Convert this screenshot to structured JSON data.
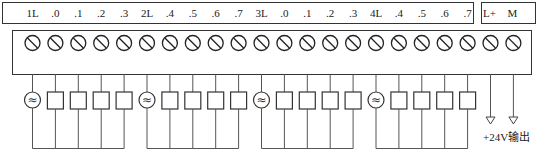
{
  "diagram": {
    "label_strip": {
      "labels": [
        "1L",
        ".0",
        ".1",
        ".2",
        ".3",
        "2L",
        ".4",
        ".5",
        ".6",
        ".7",
        "3L",
        ".0",
        ".1",
        ".2",
        ".3",
        "4L",
        ".4",
        ".5",
        ".6",
        ".7"
      ]
    },
    "power_strip": {
      "labels": [
        "L+",
        "M"
      ]
    },
    "terminal_count": 22,
    "groups": [
      {
        "common": "1L",
        "outputs": [
          ".0",
          ".1",
          ".2",
          ".3"
        ],
        "source": "ac-source"
      },
      {
        "common": "2L",
        "outputs": [
          ".4",
          ".5",
          ".6",
          ".7"
        ],
        "source": "ac-source"
      },
      {
        "common": "3L",
        "outputs": [
          ".0",
          ".1",
          ".2",
          ".3"
        ],
        "source": "ac-source"
      },
      {
        "common": "4L",
        "outputs": [
          ".4",
          ".5",
          ".6",
          ".7"
        ],
        "source": "ac-source"
      }
    ],
    "ac_symbol": "≈",
    "output_note": "+24V输出"
  }
}
